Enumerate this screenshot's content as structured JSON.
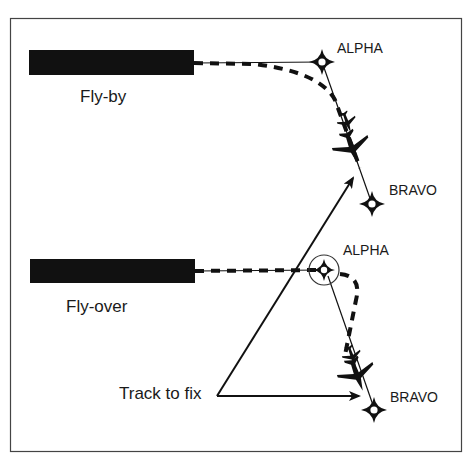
{
  "diagram": {
    "colors": {
      "ink": "#111111",
      "background": "#ffffff",
      "frame": "#444444"
    },
    "sections": [
      {
        "id": "fly-by",
        "label": "Fly-by",
        "fixes": [
          {
            "name": "ALPHA",
            "type": "fly-by"
          },
          {
            "name": "BRAVO",
            "type": "fly-by"
          }
        ]
      },
      {
        "id": "fly-over",
        "label": "Fly-over",
        "fixes": [
          {
            "name": "ALPHA",
            "type": "fly-over"
          },
          {
            "name": "BRAVO",
            "type": "fly-by"
          }
        ]
      }
    ],
    "callout": {
      "label": "Track to fix"
    }
  }
}
